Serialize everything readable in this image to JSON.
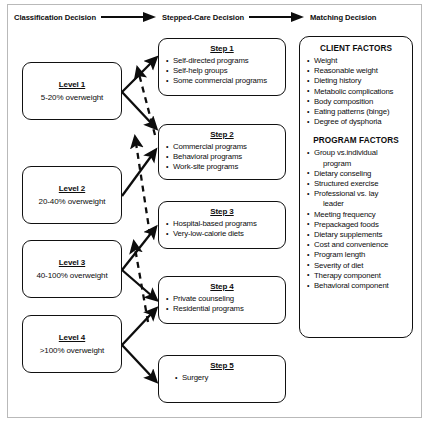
{
  "header": {
    "steps": [
      {
        "label": "Classification Decision"
      },
      {
        "label": "Stepped-Care Decision"
      },
      {
        "label": "Matching Decision"
      }
    ],
    "arrow_icon": "right-arrow-icon"
  },
  "levels": [
    {
      "title": "Level 1",
      "subtitle": "5-20% overweight"
    },
    {
      "title": "Level 2",
      "subtitle": "20-40% overweight"
    },
    {
      "title": "Level 3",
      "subtitle": "40-100% overweight"
    },
    {
      "title": "Level 4",
      "subtitle": ">100% overweight"
    }
  ],
  "steps": [
    {
      "title": "Step 1",
      "items": [
        {
          "text": "Self-directed programs",
          "cont": false
        },
        {
          "text": "Self-help groups",
          "cont": false
        },
        {
          "text": "Some commercial programs",
          "cont": false
        }
      ]
    },
    {
      "title": "Step 2",
      "items": [
        {
          "text": "Commercial programs",
          "cont": false
        },
        {
          "text": "Behavioral programs",
          "cont": false
        },
        {
          "text": "Work-site programs",
          "cont": false
        }
      ]
    },
    {
      "title": "Step 3",
      "items": [
        {
          "text": "Hospital-based programs",
          "cont": false
        },
        {
          "text": "Very-low-calorie diets",
          "cont": false
        }
      ]
    },
    {
      "title": "Step 4",
      "items": [
        {
          "text": "Private counseling",
          "cont": false
        },
        {
          "text": "Residential programs",
          "cont": false
        }
      ]
    },
    {
      "title": "Step 5",
      "items": [
        {
          "text": "Surgery",
          "cont": false
        }
      ]
    }
  ],
  "factors": {
    "client": {
      "heading": "CLIENT FACTORS",
      "items": [
        {
          "text": "Weight",
          "cont": false
        },
        {
          "text": "Reasonable weight",
          "cont": false
        },
        {
          "text": "Dieting history",
          "cont": false
        },
        {
          "text": "Metabolic complications",
          "cont": false
        },
        {
          "text": "Body composition",
          "cont": false
        },
        {
          "text": "Eating patterns (binge)",
          "cont": false
        },
        {
          "text": "Degree of dysphoria",
          "cont": false
        }
      ]
    },
    "program": {
      "heading": "PROGRAM FACTORS",
      "items": [
        {
          "text": "Group vs.individual",
          "cont": false
        },
        {
          "text": "program",
          "cont": true
        },
        {
          "text": "Dietary conseling",
          "cont": false
        },
        {
          "text": "Structured exercise",
          "cont": false
        },
        {
          "text": "Professional vs. lay",
          "cont": false
        },
        {
          "text": "leader",
          "cont": true
        },
        {
          "text": "Meeting frequency",
          "cont": false
        },
        {
          "text": "Prepackaged foods",
          "cont": false
        },
        {
          "text": "Dietary supplements",
          "cont": false
        },
        {
          "text": "Cost and convenience",
          "cont": false
        },
        {
          "text": "Program length",
          "cont": false
        },
        {
          "text": "Severity of diet",
          "cont": false
        },
        {
          "text": "Therapy component",
          "cont": false
        },
        {
          "text": "Behavioral component",
          "cont": false
        }
      ]
    }
  },
  "colors": {
    "ink": "#0d0d0d",
    "frame": "#b9b9b9",
    "background": "#ffffff"
  }
}
